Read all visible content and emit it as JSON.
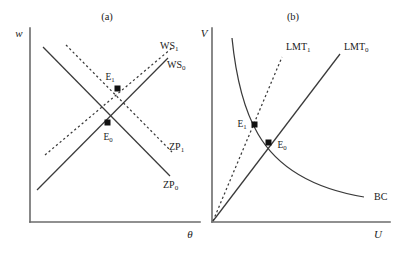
{
  "figure": {
    "panels": [
      {
        "id": "panel-a",
        "title": "(a)",
        "y_axis_label": "w",
        "x_axis_label": "θ",
        "curves": [
          {
            "name": "WS1",
            "label_text": "WS",
            "label_sub": "1",
            "style": "dashed",
            "shape": "upward-sloping-line"
          },
          {
            "name": "WS0",
            "label_text": "WS",
            "label_sub": "0",
            "style": "solid",
            "shape": "upward-sloping-line"
          },
          {
            "name": "ZP1",
            "label_text": "ZP",
            "label_sub": "1",
            "style": "dashed",
            "shape": "downward-sloping-line"
          },
          {
            "name": "ZP0",
            "label_text": "ZP",
            "label_sub": "0",
            "style": "solid",
            "shape": "downward-sloping-line"
          }
        ],
        "equilibria": [
          {
            "name": "E1",
            "label_text": "E",
            "label_sub": "1"
          },
          {
            "name": "E0",
            "label_text": "E",
            "label_sub": "0"
          }
        ]
      },
      {
        "id": "panel-b",
        "title": "(b)",
        "y_axis_label": "V",
        "x_axis_label": "U",
        "curves": [
          {
            "name": "LMT1",
            "label_text": "LMT",
            "label_sub": "1",
            "style": "dashed",
            "shape": "ray-from-origin"
          },
          {
            "name": "LMT0",
            "label_text": "LMT",
            "label_sub": "0",
            "style": "solid",
            "shape": "ray-from-origin"
          },
          {
            "name": "BC",
            "label_text": "BC",
            "label_sub": "",
            "style": "solid",
            "shape": "convex-decreasing-curve"
          }
        ],
        "equilibria": [
          {
            "name": "E1",
            "label_text": "E",
            "label_sub": "1"
          },
          {
            "name": "E0",
            "label_text": "E",
            "label_sub": "0"
          }
        ]
      }
    ],
    "colors": {
      "axis": "#6b6b6b",
      "curve": "#3a3a3a",
      "marker": "#111111",
      "text": "#1a1a1a",
      "background": "#ffffff"
    }
  }
}
